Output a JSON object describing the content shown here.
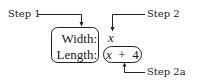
{
  "diagram": {
    "labels": {
      "step1": "Step 1",
      "step2": "Step 2",
      "step2a": "Step 2a"
    },
    "left_box": {
      "rows": [
        "Width:",
        "Length:"
      ]
    },
    "values": {
      "width_value": "x",
      "length_value": "(x + 4)"
    },
    "colors": {
      "ink": "#222222",
      "background": "#ffffff"
    }
  }
}
